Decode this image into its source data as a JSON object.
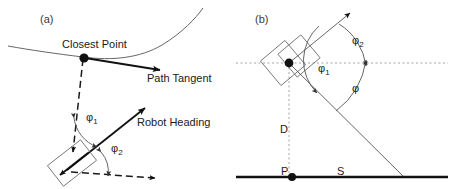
{
  "figure": {
    "panels": [
      {
        "id": "a",
        "tag": "(a)",
        "labels": {
          "closest_point": "Closest Point",
          "path_tangent": "Path Tangent",
          "robot_heading": "Robot Heading",
          "phi1": "φ",
          "phi1_sub": "1",
          "phi2": "φ",
          "phi2_sub": "2"
        }
      },
      {
        "id": "b",
        "tag": "(b)",
        "labels": {
          "phi1": "φ",
          "phi1_sub": "1",
          "phi2": "φ",
          "phi2_sub": "2",
          "phi": "φ",
          "distance": "D",
          "point_p": "P",
          "surface_s": "S"
        }
      }
    ],
    "colors": {
      "stroke_dark": "#111111",
      "stroke_mid": "#555555",
      "stroke_light": "#9a9a9a",
      "background": "#ffffff"
    }
  }
}
